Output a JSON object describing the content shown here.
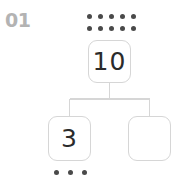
{
  "item": {
    "problem_number": "01",
    "type": "number-bond"
  },
  "whole": {
    "box_value": "10",
    "dot_count": 10,
    "dot_rows": 2,
    "dot_columns": 5
  },
  "parts": [
    {
      "position": "left",
      "box_value": "3",
      "dot_count": 3,
      "is_blank": false
    },
    {
      "position": "right",
      "box_value": "",
      "dot_count": 0,
      "is_blank": true
    }
  ],
  "colors": {
    "label": "#b3b3b3",
    "dot": "#4a4a4a",
    "box_border": "#d6d6d6",
    "connector": "#d6d6d6",
    "digit": "#2b2b2b",
    "background": "#ffffff"
  }
}
